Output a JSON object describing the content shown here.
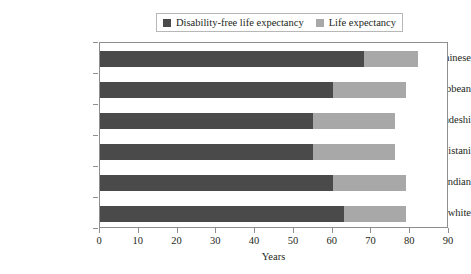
{
  "chart_data": {
    "type": "bar",
    "orientation": "horizontal",
    "stacked": true,
    "title": "",
    "xlabel": "Years",
    "ylabel": "",
    "xlim": [
      0,
      90
    ],
    "xticks": [
      0,
      10,
      20,
      30,
      40,
      50,
      60,
      70,
      80,
      90
    ],
    "grid": false,
    "legend_position": "top-center",
    "categories": [
      "Chinese",
      "Black Caribbean",
      "Bangladeshi",
      "Pakistani",
      "Indian",
      "British white"
    ],
    "series": [
      {
        "name": "Disability-free life expectancy",
        "color": "#4a4a4a",
        "values": [
          68,
          60,
          55,
          55,
          60,
          63
        ]
      },
      {
        "name": "Life expectancy",
        "color": "#a8a8a8",
        "values": [
          82,
          79,
          76,
          76,
          79,
          79
        ]
      }
    ]
  },
  "legend": {
    "items": [
      {
        "label": "Disability-free life expectancy",
        "color": "#4a4a4a"
      },
      {
        "label": "Life expectancy",
        "color": "#a8a8a8"
      }
    ]
  },
  "axes": {
    "x_title": "Years",
    "x_tick_labels": [
      "0",
      "10",
      "20",
      "30",
      "40",
      "50",
      "60",
      "70",
      "80",
      "90"
    ],
    "y_tick_labels": [
      "Chinese",
      "Black Caribbean",
      "Bangladeshi",
      "Pakistani",
      "Indian",
      "British white"
    ]
  },
  "colors": {
    "dark_series": "#4a4a4a",
    "light_series": "#a8a8a8",
    "axis": "#8e8e8e",
    "text": "#231f20",
    "background": "#ffffff"
  }
}
